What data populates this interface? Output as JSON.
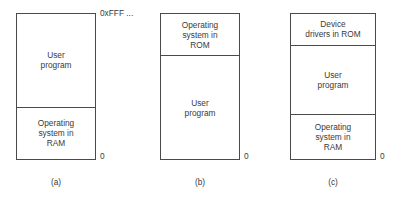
{
  "figure": {
    "kind": "memory-layout-diagram",
    "columns": [
      {
        "caption": "(a)",
        "top_address": "0xFFF ...",
        "bottom_address": "0",
        "regions": [
          {
            "name": "user-program",
            "label": "User\nprogram",
            "height_pct": 64.6
          },
          {
            "name": "operating-system",
            "label": "Operating\nsystem in\nRAM",
            "height_pct": 35.4
          }
        ]
      },
      {
        "caption": "(b)",
        "top_address": "",
        "bottom_address": "0",
        "regions": [
          {
            "name": "operating-system",
            "label": "Operating\nsystem in\nROM",
            "height_pct": 29.3
          },
          {
            "name": "user-program",
            "label": "User\nprogram",
            "height_pct": 70.7
          }
        ]
      },
      {
        "caption": "(c)",
        "top_address": "",
        "bottom_address": "0",
        "regions": [
          {
            "name": "device-drivers",
            "label": "Device\ndrivers in ROM",
            "height_pct": 21.8
          },
          {
            "name": "user-program",
            "label": "User\nprogram",
            "height_pct": 47.6
          },
          {
            "name": "operating-system",
            "label": "Operating\nsystem in\nRAM",
            "height_pct": 30.6
          }
        ]
      }
    ]
  },
  "colors": {
    "stroke": "#4a4a4a",
    "text": "#3a3a3a",
    "background": "#ffffff"
  }
}
